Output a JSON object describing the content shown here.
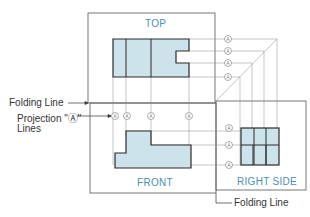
{
  "views": {
    "top": {
      "label": "TOP"
    },
    "front": {
      "label": "FRONT"
    },
    "right_side": {
      "label": "RIGHT SIDE"
    }
  },
  "annotations": {
    "folding_line_left": "Folding Line",
    "projection_lines_line1": "Projection \"Ⓐ\"",
    "projection_lines_line2": "Lines",
    "folding_line_bottom": "Folding Line"
  },
  "marker": {
    "symbol": "A"
  },
  "colors": {
    "fill": "#cde3ec",
    "outline": "#2a2a2a",
    "thin_line": "#777777",
    "view_label": "#4a8fb4",
    "annotation_text": "#333333"
  }
}
